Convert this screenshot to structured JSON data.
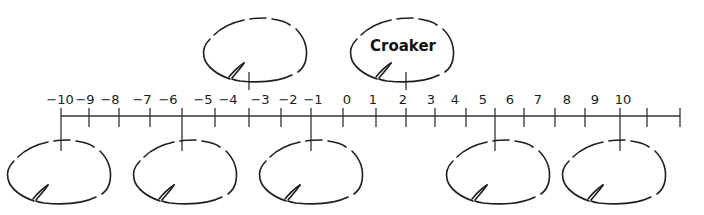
{
  "diagram": {
    "type": "number-line-with-lily-pads",
    "number_line": {
      "min": -10,
      "max": 10,
      "labels": [
        "−10",
        "−9",
        "−8",
        "−7",
        "−6",
        "−5",
        "−4",
        "−3",
        "−2",
        "−1",
        "0",
        "1",
        "2",
        "3",
        "4",
        "5",
        "6",
        "7",
        "8",
        "9",
        "10"
      ],
      "label_x": [
        60,
        85,
        110,
        142,
        168,
        203,
        228,
        260,
        288,
        313,
        347,
        373,
        403,
        431,
        455,
        483,
        510,
        538,
        567,
        595,
        623
      ],
      "tick_x": [
        61,
        89,
        119,
        150,
        182,
        215,
        249,
        281,
        311,
        343,
        376,
        406,
        435,
        466,
        495,
        524,
        555,
        585,
        620,
        647,
        680
      ],
      "line_y": 116,
      "line_x_start": 61,
      "line_x_end": 680,
      "line_color": "#333333"
    },
    "lily_pads": [
      {
        "position": "top",
        "label": "",
        "tick_x": 249,
        "left": 200,
        "top": 15
      },
      {
        "position": "top",
        "label": "Croaker",
        "tick_x": 406,
        "left": 347,
        "top": 15
      },
      {
        "position": "bottom",
        "label": "",
        "tick_x": 61,
        "left": 4,
        "top": 137
      },
      {
        "position": "bottom",
        "label": "",
        "tick_x": 182,
        "left": 130,
        "top": 137
      },
      {
        "position": "bottom",
        "label": "",
        "tick_x": 311,
        "left": 256,
        "top": 137
      },
      {
        "position": "bottom",
        "label": "",
        "tick_x": 495,
        "left": 443,
        "top": 137
      },
      {
        "position": "bottom",
        "label": "",
        "tick_x": 620,
        "left": 559,
        "top": 137
      }
    ]
  }
}
